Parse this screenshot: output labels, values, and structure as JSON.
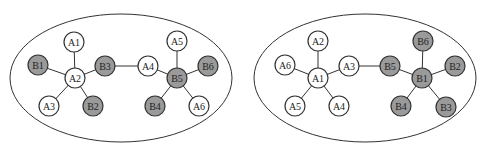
{
  "colors": {
    "background": "#ffffff",
    "stroke": "#333333",
    "node_a_fill": "#ffffff",
    "node_b_fill": "#9a9a9a"
  },
  "diagrams": [
    {
      "name": "left-network",
      "ellipse": {
        "cx": 121,
        "cy": 78,
        "rx": 111,
        "ry": 64
      },
      "nodes": [
        {
          "id": "A1",
          "x": 74,
          "y": 42,
          "type": "A"
        },
        {
          "id": "B1",
          "x": 38,
          "y": 65,
          "type": "B"
        },
        {
          "id": "A2",
          "x": 75,
          "y": 78,
          "type": "A"
        },
        {
          "id": "B3",
          "x": 105,
          "y": 66,
          "type": "B"
        },
        {
          "id": "A3",
          "x": 49,
          "y": 106,
          "type": "A"
        },
        {
          "id": "B2",
          "x": 93,
          "y": 106,
          "type": "B"
        },
        {
          "id": "A4",
          "x": 148,
          "y": 66,
          "type": "A"
        },
        {
          "id": "A5",
          "x": 177,
          "y": 41,
          "type": "A"
        },
        {
          "id": "B5",
          "x": 177,
          "y": 78,
          "type": "B"
        },
        {
          "id": "B6",
          "x": 208,
          "y": 66,
          "type": "B"
        },
        {
          "id": "B4",
          "x": 155,
          "y": 106,
          "type": "B"
        },
        {
          "id": "A6",
          "x": 199,
          "y": 106,
          "type": "A"
        }
      ],
      "edges": [
        [
          "A2",
          "A1"
        ],
        [
          "A2",
          "B1"
        ],
        [
          "A2",
          "B3"
        ],
        [
          "A2",
          "A3"
        ],
        [
          "A2",
          "B2"
        ],
        [
          "B3",
          "A4"
        ],
        [
          "B5",
          "A4"
        ],
        [
          "B5",
          "A5"
        ],
        [
          "B5",
          "B6"
        ],
        [
          "B5",
          "B4"
        ],
        [
          "B5",
          "A6"
        ]
      ]
    },
    {
      "name": "right-network",
      "ellipse": {
        "cx": 365,
        "cy": 78,
        "rx": 111,
        "ry": 64
      },
      "nodes": [
        {
          "id": "A2",
          "x": 318,
          "y": 41,
          "type": "A"
        },
        {
          "id": "A6",
          "x": 285,
          "y": 65,
          "type": "A"
        },
        {
          "id": "A1",
          "x": 318,
          "y": 78,
          "type": "A"
        },
        {
          "id": "A3",
          "x": 349,
          "y": 66,
          "type": "A"
        },
        {
          "id": "A5",
          "x": 295,
          "y": 106,
          "type": "A"
        },
        {
          "id": "A4",
          "x": 339,
          "y": 106,
          "type": "A"
        },
        {
          "id": "B5",
          "x": 390,
          "y": 66,
          "type": "B"
        },
        {
          "id": "B6",
          "x": 423,
          "y": 41,
          "type": "B"
        },
        {
          "id": "B1",
          "x": 422,
          "y": 78,
          "type": "B"
        },
        {
          "id": "B2",
          "x": 455,
          "y": 66,
          "type": "B"
        },
        {
          "id": "B4",
          "x": 401,
          "y": 106,
          "type": "B"
        },
        {
          "id": "B3",
          "x": 446,
          "y": 107,
          "type": "B"
        }
      ],
      "edges": [
        [
          "A1",
          "A2"
        ],
        [
          "A1",
          "A6"
        ],
        [
          "A1",
          "A3"
        ],
        [
          "A1",
          "A5"
        ],
        [
          "A1",
          "A4"
        ],
        [
          "A3",
          "B5"
        ],
        [
          "B1",
          "B5"
        ],
        [
          "B1",
          "B6"
        ],
        [
          "B1",
          "B2"
        ],
        [
          "B1",
          "B4"
        ],
        [
          "B1",
          "B3"
        ]
      ]
    }
  ],
  "node_radius": 10
}
